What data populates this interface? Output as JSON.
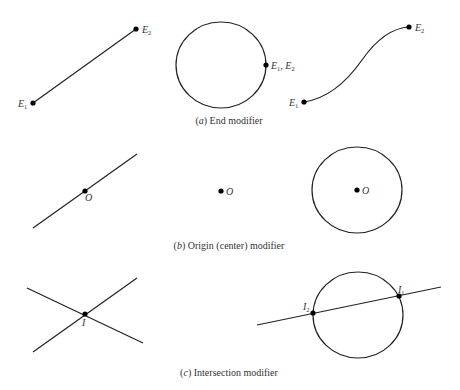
{
  "figure": {
    "panels": [
      {
        "id": "a",
        "caption_letter": "a",
        "caption_text": "End modifier",
        "items": [
          {
            "shape": "line",
            "points": [
              {
                "label": "E",
                "sub": "1"
              },
              {
                "label": "E",
                "sub": "2"
              }
            ]
          },
          {
            "shape": "circle",
            "points": [
              {
                "label": "E",
                "sub": "1",
                "label2": "E",
                "sub2": "2",
                "sep": ", "
              }
            ]
          },
          {
            "shape": "curve",
            "points": [
              {
                "label": "E",
                "sub": "1"
              },
              {
                "label": "E",
                "sub": "2"
              }
            ]
          }
        ]
      },
      {
        "id": "b",
        "caption_letter": "b",
        "caption_text": "Origin (center) modifier",
        "items": [
          {
            "shape": "line",
            "points": [
              {
                "label": "O"
              }
            ]
          },
          {
            "shape": "point",
            "points": [
              {
                "label": "O"
              }
            ]
          },
          {
            "shape": "circle",
            "points": [
              {
                "label": "O"
              }
            ]
          }
        ]
      },
      {
        "id": "c",
        "caption_letter": "c",
        "caption_text": "Intersection modifier",
        "items": [
          {
            "shape": "crossing-lines",
            "points": [
              {
                "label": "I"
              }
            ]
          },
          {
            "shape": "line-through-circle",
            "points": [
              {
                "label": "I",
                "sub": "1"
              },
              {
                "label": "I",
                "sub": "2"
              }
            ]
          }
        ]
      }
    ],
    "colors": {
      "ink": "#222222",
      "text": "#333333",
      "background": "#ffffff"
    }
  }
}
